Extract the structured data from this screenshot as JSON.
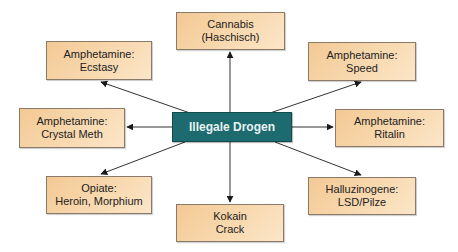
{
  "diagram": {
    "type": "hub-and-spoke",
    "center": {
      "label": "Illegale Drogen",
      "color": "#1d6a6f"
    },
    "node_color": "#f6d3a4",
    "nodes": [
      {
        "id": "cannabis",
        "line1": "Cannabis",
        "line2": "(Haschisch)"
      },
      {
        "id": "speed",
        "line1": "Amphetamine:",
        "line2": "Speed"
      },
      {
        "id": "ritalin",
        "line1": "Amphetamine:",
        "line2": "Ritalin"
      },
      {
        "id": "halluzinogene",
        "line1": "Halluzinogene:",
        "line2": "LSD/Pilze"
      },
      {
        "id": "kokain",
        "line1": "Kokain",
        "line2": "Crack"
      },
      {
        "id": "opiate",
        "line1": "Opiate:",
        "line2": "Heroin, Morphium"
      },
      {
        "id": "crystal-meth",
        "line1": "Amphetamine:",
        "line2": "Crystal Meth"
      },
      {
        "id": "ecstasy",
        "line1": "Amphetamine:",
        "line2": "Ecstasy"
      }
    ],
    "edges": [
      {
        "from": "Illegale Drogen",
        "to": "Cannabis (Haschisch)"
      },
      {
        "from": "Illegale Drogen",
        "to": "Amphetamine: Speed"
      },
      {
        "from": "Illegale Drogen",
        "to": "Amphetamine: Ritalin"
      },
      {
        "from": "Illegale Drogen",
        "to": "Halluzinogene: LSD/Pilze"
      },
      {
        "from": "Illegale Drogen",
        "to": "Kokain Crack"
      },
      {
        "from": "Illegale Drogen",
        "to": "Opiate: Heroin, Morphium"
      },
      {
        "from": "Illegale Drogen",
        "to": "Amphetamine: Crystal Meth"
      },
      {
        "from": "Illegale Drogen",
        "to": "Amphetamine: Ecstasy"
      }
    ]
  }
}
